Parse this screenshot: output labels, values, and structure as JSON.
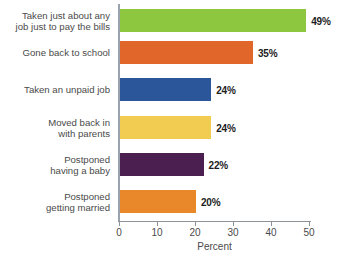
{
  "chart_data": {
    "type": "bar",
    "orientation": "horizontal",
    "title": "",
    "xlabel": "Percent",
    "ylabel": "",
    "xlim": [
      0,
      50
    ],
    "xticks": [
      0,
      10,
      20,
      30,
      40,
      50
    ],
    "xtick_labels": [
      "0",
      "10",
      "20",
      "30",
      "40",
      "50"
    ],
    "grid": false,
    "legend": "none",
    "categories": [
      "Taken just about any\njob just to pay the bills",
      "Gone back to school",
      "Taken an unpaid job",
      "Moved back in\nwith parents",
      "Postponed\nhaving a baby",
      "Postponed\ngetting married"
    ],
    "values": [
      49,
      35,
      24,
      24,
      22,
      20
    ],
    "value_labels": [
      "49%",
      "35%",
      "24%",
      "24%",
      "22%",
      "20%"
    ],
    "colors": [
      "#8DC63F",
      "#E0662A",
      "#2B5699",
      "#F2CC51",
      "#4B1F4F",
      "#E8882A"
    ],
    "bars": [
      {
        "category": "Taken just about any\njob just to pay the bills",
        "value": 49,
        "value_label": "49%",
        "color": "#8DC63F"
      },
      {
        "category": "Gone back to school",
        "value": 35,
        "value_label": "35%",
        "color": "#E0662A"
      },
      {
        "category": "Taken an unpaid job",
        "value": 24,
        "value_label": "24%",
        "color": "#2B5699"
      },
      {
        "category": "Moved back in\nwith parents",
        "value": 24,
        "value_label": "24%",
        "color": "#F2CC51"
      },
      {
        "category": "Postponed\nhaving a baby",
        "value": 22,
        "value_label": "22%",
        "color": "#4B1F4F"
      },
      {
        "category": "Postponed\ngetting married",
        "value": 20,
        "value_label": "20%",
        "color": "#E8882A"
      }
    ]
  },
  "axis": {
    "line_color": "#8e9398",
    "text_color": "#4a4a4a"
  },
  "background_color": "#ffffff"
}
